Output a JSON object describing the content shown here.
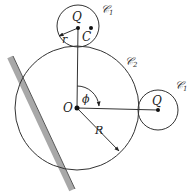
{
  "diagram": {
    "type": "geometry",
    "labels": {
      "top_center": "Q",
      "top_point": "C",
      "top_radius": "r",
      "top_circle": "𝒞",
      "top_circle_sub": "1",
      "big_circle": "𝒞",
      "big_circle_sub": "2",
      "origin": "O",
      "angle": "ϕ",
      "big_radius": "R",
      "right_center": "Q",
      "right_circle": "𝒞",
      "right_circle_sub": "1"
    },
    "colors": {
      "stroke": "#333333",
      "wall": "#a8a8a8"
    }
  }
}
